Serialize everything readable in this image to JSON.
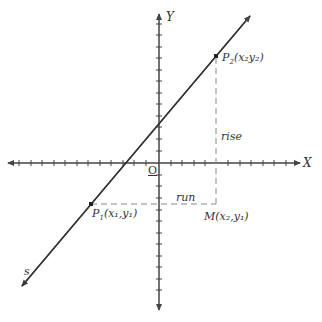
{
  "axes": {
    "x_label": "X",
    "y_label": "Y",
    "origin_label": "O"
  },
  "line_label": "s",
  "points": {
    "p1": {
      "name": "P",
      "sub": "1",
      "coords": "(x₁,y₁)"
    },
    "p2": {
      "name": "P",
      "sub": "2",
      "coords": "(x₂y₂)"
    },
    "m": {
      "name": "M",
      "coords": "(x₂,y₁)"
    }
  },
  "annotations": {
    "rise": "rise",
    "run": "run"
  },
  "colors": {
    "line": "#333333",
    "axis": "#444444",
    "dashed": "#888888"
  }
}
